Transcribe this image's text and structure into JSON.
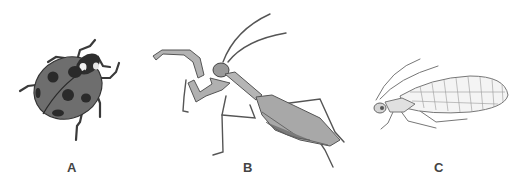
{
  "figure": {
    "panels": [
      {
        "label": "A",
        "subject": "ladybug"
      },
      {
        "label": "B",
        "subject": "praying mantis"
      },
      {
        "label": "C",
        "subject": "lacewing"
      }
    ]
  },
  "colors": {
    "background": "#ffffff",
    "ink": "#444444",
    "ladybug_body": "#6e6e6e",
    "ladybug_spots": "#2a2a2a",
    "mantis_body": "#a8a8a8",
    "lacewing_line": "#777777"
  }
}
